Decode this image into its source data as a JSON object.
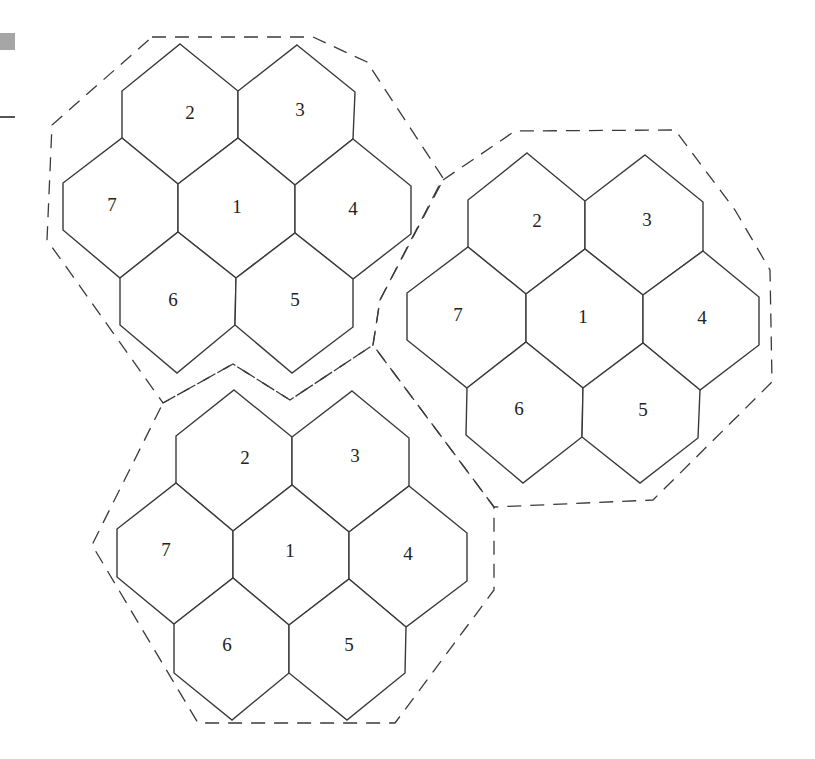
{
  "diagram": {
    "colors": {
      "stroke": "#3a3a3a",
      "fill": "#ffffff",
      "label": "#222222",
      "corner_box": "#a6a6a6"
    },
    "clusters": [
      {
        "id": "cluster-top-left",
        "outline": [
          [
            152,
            37
          ],
          [
            313,
            37
          ],
          [
            367,
            62
          ],
          [
            443,
            178
          ],
          [
            380,
            300
          ],
          [
            373,
            345
          ],
          [
            290,
            400
          ],
          [
            233,
            364
          ],
          [
            163,
            403
          ],
          [
            47,
            240
          ],
          [
            52,
            125
          ]
        ],
        "cells": [
          {
            "label": "2",
            "pos": [
              190,
              115
            ],
            "pts": [
              [
                180,
                44
              ],
              [
                238,
                91
              ],
              [
                238,
                138
              ],
              [
                178,
                184
              ],
              [
                122,
                138
              ],
              [
                122,
                91
              ]
            ]
          },
          {
            "label": "3",
            "pos": [
              300,
              112
            ],
            "pts": [
              [
                297,
                45
              ],
              [
                355,
                92
              ],
              [
                353,
                139
              ],
              [
                295,
                185
              ],
              [
                238,
                138
              ],
              [
                238,
                91
              ]
            ]
          },
          {
            "label": "7",
            "pos": [
              112,
              207
            ],
            "pts": [
              [
                122,
                138
              ],
              [
                178,
                184
              ],
              [
                178,
                232
              ],
              [
                120,
                278
              ],
              [
                63,
                230
              ],
              [
                63,
                183
              ]
            ]
          },
          {
            "label": "1",
            "pos": [
              237,
              209
            ],
            "pts": [
              [
                238,
                138
              ],
              [
                295,
                185
              ],
              [
                295,
                233
              ],
              [
                236,
                278
              ],
              [
                178,
                232
              ],
              [
                178,
                184
              ]
            ]
          },
          {
            "label": "4",
            "pos": [
              353,
              211
            ],
            "pts": [
              [
                353,
                139
              ],
              [
                411,
                186
              ],
              [
                411,
                234
              ],
              [
                353,
                279
              ],
              [
                295,
                233
              ],
              [
                295,
                185
              ]
            ]
          },
          {
            "label": "6",
            "pos": [
              173,
              302
            ],
            "pts": [
              [
                178,
                232
              ],
              [
                236,
                278
              ],
              [
                235,
                325
              ],
              [
                177,
                373
              ],
              [
                120,
                325
              ],
              [
                120,
                278
              ]
            ]
          },
          {
            "label": "5",
            "pos": [
              295,
              302
            ],
            "pts": [
              [
                295,
                233
              ],
              [
                353,
                279
              ],
              [
                353,
                327
              ],
              [
                292,
                373
              ],
              [
                235,
                325
              ],
              [
                236,
                278
              ]
            ]
          }
        ]
      },
      {
        "id": "cluster-right",
        "outline": [
          [
            443,
            180
          ],
          [
            515,
            131
          ],
          [
            675,
            130
          ],
          [
            735,
            210
          ],
          [
            770,
            270
          ],
          [
            772,
            382
          ],
          [
            653,
            500
          ],
          [
            494,
            507
          ],
          [
            373,
            345
          ],
          [
            380,
            300
          ]
        ],
        "cells": [
          {
            "label": "2",
            "pos": [
              537,
              223
            ],
            "pts": [
              [
                527,
                153
              ],
              [
                585,
                201
              ],
              [
                585,
                249
              ],
              [
                526,
                294
              ],
              [
                468,
                247
              ],
              [
                468,
                200
              ]
            ]
          },
          {
            "label": "3",
            "pos": [
              647,
              222
            ],
            "pts": [
              [
                645,
                155
              ],
              [
                703,
                202
              ],
              [
                703,
                251
              ],
              [
                643,
                295
              ],
              [
                585,
                249
              ],
              [
                585,
                201
              ]
            ]
          },
          {
            "label": "7",
            "pos": [
              458,
              317
            ],
            "pts": [
              [
                468,
                247
              ],
              [
                526,
                294
              ],
              [
                526,
                342
              ],
              [
                467,
                388
              ],
              [
                407,
                340
              ],
              [
                407,
                293
              ]
            ]
          },
          {
            "label": "1",
            "pos": [
              583,
              319
            ],
            "pts": [
              [
                585,
                249
              ],
              [
                643,
                295
              ],
              [
                643,
                343
              ],
              [
                583,
                388
              ],
              [
                526,
                342
              ],
              [
                526,
                294
              ]
            ]
          },
          {
            "label": "4",
            "pos": [
              702,
              320
            ],
            "pts": [
              [
                703,
                251
              ],
              [
                759,
                297
              ],
              [
                759,
                345
              ],
              [
                700,
                390
              ],
              [
                643,
                343
              ],
              [
                643,
                295
              ]
            ]
          },
          {
            "label": "6",
            "pos": [
              519,
              411
            ],
            "pts": [
              [
                526,
                342
              ],
              [
                583,
                388
              ],
              [
                582,
                437
              ],
              [
                523,
                483
              ],
              [
                466,
                435
              ],
              [
                467,
                388
              ]
            ]
          },
          {
            "label": "5",
            "pos": [
              643,
              412
            ],
            "pts": [
              [
                643,
                343
              ],
              [
                700,
                390
              ],
              [
                698,
                438
              ],
              [
                640,
                483
              ],
              [
                582,
                437
              ],
              [
                583,
                388
              ]
            ]
          }
        ]
      },
      {
        "id": "cluster-bottom",
        "outline": [
          [
            163,
            403
          ],
          [
            233,
            364
          ],
          [
            290,
            400
          ],
          [
            373,
            345
          ],
          [
            494,
            507
          ],
          [
            494,
            590
          ],
          [
            395,
            723
          ],
          [
            198,
            723
          ],
          [
            92,
            545
          ]
        ],
        "cells": [
          {
            "label": "2",
            "pos": [
              245,
              460
            ],
            "pts": [
              [
                234,
                390
              ],
              [
                292,
                437
              ],
              [
                292,
                485
              ],
              [
                233,
                531
              ],
              [
                176,
                483
              ],
              [
                176,
                436
              ]
            ]
          },
          {
            "label": "3",
            "pos": [
              355,
              458
            ],
            "pts": [
              [
                352,
                391
              ],
              [
                409,
                438
              ],
              [
                409,
                486
              ],
              [
                349,
                532
              ],
              [
                292,
                485
              ],
              [
                292,
                437
              ]
            ]
          },
          {
            "label": "7",
            "pos": [
              166,
              552
            ],
            "pts": [
              [
                176,
                483
              ],
              [
                233,
                531
              ],
              [
                233,
                578
              ],
              [
                174,
                624
              ],
              [
                117,
                577
              ],
              [
                117,
                529
              ]
            ]
          },
          {
            "label": "1",
            "pos": [
              290,
              553
            ],
            "pts": [
              [
                292,
                485
              ],
              [
                349,
                532
              ],
              [
                349,
                579
              ],
              [
                289,
                625
              ],
              [
                233,
                578
              ],
              [
                233,
                531
              ]
            ]
          },
          {
            "label": "4",
            "pos": [
              408,
              556
            ],
            "pts": [
              [
                409,
                486
              ],
              [
                467,
                533
              ],
              [
                467,
                581
              ],
              [
                406,
                627
              ],
              [
                349,
                579
              ],
              [
                349,
                532
              ]
            ]
          },
          {
            "label": "6",
            "pos": [
              227,
              647
            ],
            "pts": [
              [
                233,
                578
              ],
              [
                289,
                625
              ],
              [
                289,
                673
              ],
              [
                232,
                720
              ],
              [
                174,
                673
              ],
              [
                174,
                624
              ]
            ]
          },
          {
            "label": "5",
            "pos": [
              349,
              647
            ],
            "pts": [
              [
                349,
                579
              ],
              [
                406,
                627
              ],
              [
                405,
                673
              ],
              [
                347,
                720
              ],
              [
                289,
                673
              ],
              [
                289,
                625
              ]
            ]
          }
        ]
      }
    ]
  }
}
